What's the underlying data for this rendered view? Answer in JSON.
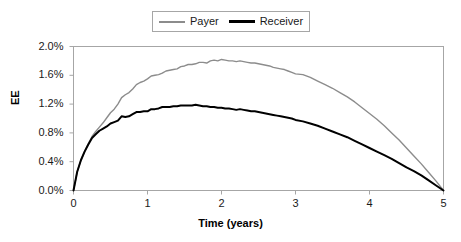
{
  "chart_data": {
    "type": "line",
    "title": "",
    "xlabel": "Time (years)",
    "ylabel": "EE",
    "xlim": [
      0,
      5
    ],
    "ylim": [
      0,
      0.02
    ],
    "grid": false,
    "legend_position": "top-center",
    "xticks": [
      "0",
      "1",
      "2",
      "3",
      "4",
      "5"
    ],
    "xtick_values": [
      0,
      1,
      2,
      3,
      4,
      5
    ],
    "yticks": [
      "0.0%",
      "0.4%",
      "0.8%",
      "1.2%",
      "1.6%",
      "2.0%"
    ],
    "ytick_values": [
      0.0,
      0.004,
      0.008,
      0.012,
      0.016,
      0.02
    ],
    "series": [
      {
        "name": "Payer",
        "color": "#8c8c8c",
        "x": [
          0.0,
          0.05,
          0.1,
          0.15,
          0.2,
          0.25,
          0.3,
          0.35,
          0.4,
          0.45,
          0.5,
          0.55,
          0.6,
          0.65,
          0.7,
          0.75,
          0.8,
          0.85,
          0.9,
          0.95,
          1.0,
          1.05,
          1.1,
          1.15,
          1.2,
          1.25,
          1.3,
          1.35,
          1.4,
          1.45,
          1.5,
          1.55,
          1.6,
          1.65,
          1.7,
          1.75,
          1.8,
          1.85,
          1.9,
          1.95,
          2.0,
          2.05,
          2.1,
          2.15,
          2.2,
          2.25,
          2.3,
          2.35,
          2.4,
          2.45,
          2.5,
          2.55,
          2.6,
          2.65,
          2.7,
          2.75,
          2.8,
          2.85,
          2.9,
          2.95,
          3.0,
          3.1,
          3.2,
          3.3,
          3.4,
          3.5,
          3.6,
          3.7,
          3.8,
          3.9,
          4.0,
          4.1,
          4.2,
          4.3,
          4.4,
          4.5,
          4.6,
          4.7,
          4.8,
          4.9,
          5.0
        ],
        "y": [
          0.0,
          0.0026,
          0.0042,
          0.0054,
          0.0065,
          0.0075,
          0.0082,
          0.0088,
          0.0094,
          0.0101,
          0.0108,
          0.0113,
          0.012,
          0.0129,
          0.0133,
          0.0136,
          0.0141,
          0.0147,
          0.015,
          0.0152,
          0.0155,
          0.0159,
          0.016,
          0.0161,
          0.0163,
          0.0166,
          0.0167,
          0.0168,
          0.0169,
          0.0172,
          0.0173,
          0.0175,
          0.0175,
          0.0176,
          0.0178,
          0.0178,
          0.0177,
          0.018,
          0.0181,
          0.018,
          0.0182,
          0.0181,
          0.018,
          0.018,
          0.0179,
          0.018,
          0.0179,
          0.0178,
          0.0177,
          0.0177,
          0.0176,
          0.0175,
          0.0174,
          0.0173,
          0.0171,
          0.017,
          0.0169,
          0.0168,
          0.0166,
          0.0164,
          0.0162,
          0.0161,
          0.0157,
          0.0152,
          0.0147,
          0.0142,
          0.0136,
          0.013,
          0.0123,
          0.0115,
          0.0107,
          0.0099,
          0.009,
          0.008,
          0.007,
          0.0059,
          0.0048,
          0.0037,
          0.0025,
          0.0013,
          0.0
        ]
      },
      {
        "name": "Receiver",
        "color": "#000000",
        "x": [
          0.0,
          0.05,
          0.1,
          0.15,
          0.2,
          0.25,
          0.3,
          0.35,
          0.4,
          0.45,
          0.5,
          0.55,
          0.6,
          0.65,
          0.7,
          0.75,
          0.8,
          0.85,
          0.9,
          0.95,
          1.0,
          1.05,
          1.1,
          1.15,
          1.2,
          1.25,
          1.3,
          1.35,
          1.4,
          1.45,
          1.5,
          1.55,
          1.6,
          1.65,
          1.7,
          1.75,
          1.8,
          1.85,
          1.9,
          1.95,
          2.0,
          2.05,
          2.1,
          2.15,
          2.2,
          2.25,
          2.3,
          2.35,
          2.4,
          2.45,
          2.5,
          2.55,
          2.6,
          2.65,
          2.7,
          2.75,
          2.8,
          2.85,
          2.9,
          2.95,
          3.0,
          3.1,
          3.2,
          3.3,
          3.4,
          3.5,
          3.6,
          3.7,
          3.8,
          3.9,
          4.0,
          4.1,
          4.2,
          4.3,
          4.4,
          4.5,
          4.6,
          4.7,
          4.8,
          4.9,
          5.0
        ],
        "y": [
          0.0,
          0.0026,
          0.0042,
          0.0054,
          0.0064,
          0.0073,
          0.0078,
          0.0083,
          0.0086,
          0.0089,
          0.0093,
          0.0095,
          0.0097,
          0.0103,
          0.0102,
          0.0103,
          0.0106,
          0.0109,
          0.0109,
          0.011,
          0.011,
          0.0113,
          0.0113,
          0.0114,
          0.0116,
          0.0116,
          0.0116,
          0.0117,
          0.0117,
          0.0118,
          0.0118,
          0.0118,
          0.0118,
          0.0119,
          0.0118,
          0.0117,
          0.0117,
          0.0116,
          0.0116,
          0.0115,
          0.0115,
          0.0114,
          0.0114,
          0.0113,
          0.0112,
          0.0113,
          0.0112,
          0.0111,
          0.011,
          0.011,
          0.0109,
          0.0108,
          0.0107,
          0.0106,
          0.0105,
          0.0104,
          0.0103,
          0.0102,
          0.0101,
          0.01,
          0.0098,
          0.0096,
          0.0093,
          0.009,
          0.0086,
          0.0082,
          0.0078,
          0.0074,
          0.0069,
          0.0064,
          0.0059,
          0.0054,
          0.0049,
          0.0044,
          0.0038,
          0.0032,
          0.0027,
          0.0021,
          0.0014,
          0.0007,
          0.0
        ]
      }
    ]
  },
  "legend": {
    "payer_label": "Payer",
    "receiver_label": "Receiver"
  },
  "axes": {
    "y_title": "EE",
    "x_title": "Time (years)"
  },
  "style": {
    "payer_color": "#8c8c8c",
    "receiver_color": "#000000",
    "axis_color": "#a6a6a6",
    "background": "#ffffff"
  }
}
